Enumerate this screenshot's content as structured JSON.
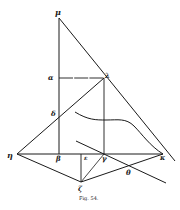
{
  "figure": {
    "caption": "Fig. 54.",
    "stroke_color": "#1a1a1a",
    "background": "#ffffff"
  },
  "labels": {
    "mu": "μ",
    "alpha": "α",
    "lambda": "λ",
    "delta": "δ",
    "eta": "η",
    "beta": "β",
    "epsilon": "ε",
    "gamma": "γ",
    "kappa": "κ",
    "theta": "θ",
    "zeta": "ζ"
  },
  "points": {
    "mu": [
      59,
      18
    ],
    "alpha": [
      59,
      78
    ],
    "lambda": [
      104,
      78
    ],
    "delta": [
      59,
      117
    ],
    "eta": [
      17,
      154
    ],
    "beta": [
      59,
      154
    ],
    "epsilon": [
      81,
      154
    ],
    "gamma": [
      104,
      154
    ],
    "kappa": [
      163,
      154
    ],
    "theta": [
      129,
      168
    ],
    "zeta": [
      81,
      182
    ]
  }
}
